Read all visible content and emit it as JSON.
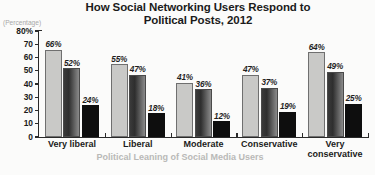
{
  "chart_data": {
    "type": "bar",
    "title": "How Social Networking Users Respond to Political Posts, 2012",
    "title_lines": [
      "How Social Networking Users Respond to",
      "Political Posts, 2012"
    ],
    "xlabel": "Political Leaning of Social Media Users",
    "ylabel": "(Percentage)",
    "categories": [
      "Very liberal",
      "Liberal",
      "Moderate",
      "Conservative",
      "Very conservative"
    ],
    "category_lines": [
      [
        "Very liberal"
      ],
      [
        "Liberal"
      ],
      [
        "Moderate"
      ],
      [
        "Conservative"
      ],
      [
        "Very",
        "conservative"
      ]
    ],
    "series": [
      {
        "name": "series-1",
        "color": "#c9c9c7",
        "values": [
          66,
          55,
          41,
          47,
          64
        ]
      },
      {
        "name": "series-2",
        "color": "#3a3a3a",
        "values": [
          52,
          47,
          36,
          37,
          49
        ]
      },
      {
        "name": "series-3",
        "color": "#0e0e0e",
        "values": [
          24,
          18,
          12,
          19,
          25
        ]
      }
    ],
    "value_labels": [
      [
        "66%",
        "55%",
        "41%",
        "47%",
        "64%"
      ],
      [
        "52%",
        "47%",
        "36%",
        "37%",
        "49%"
      ],
      [
        "24%",
        "18%",
        "12%",
        "19%",
        "25%"
      ]
    ],
    "ylim": [
      0,
      80
    ],
    "yticks": [
      0,
      10,
      20,
      30,
      40,
      50,
      60,
      70,
      80
    ],
    "ytick_labels": [
      "0",
      "10",
      "20",
      "30",
      "40",
      "50",
      "60",
      "70",
      "80%"
    ],
    "grid": false,
    "legend": "none"
  }
}
